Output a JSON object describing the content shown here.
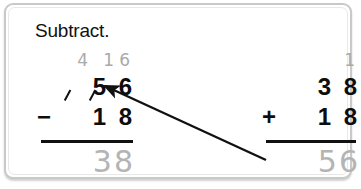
{
  "worksheet": {
    "prompt": "Subtract.",
    "problems": [
      {
        "id": "subtraction",
        "regroup": "4 16",
        "minuend": "5 6",
        "operator": "−",
        "subtrahend": "1 8",
        "answer": "38",
        "crossed_out": true
      },
      {
        "id": "addition-check",
        "regroup": "1",
        "minuend": "3 8",
        "operator": "+",
        "subtrahend": "1 8",
        "answer": "56",
        "crossed_out": false
      }
    ],
    "arrow": {
      "name": "check-arrow",
      "from_label": "56",
      "to_label": "56",
      "color": "#111111"
    },
    "colors": {
      "ink": "#0d0d0d",
      "pencil_gray": "#b4b4b4",
      "frame": "#c9c9c9",
      "page": "#ffffff"
    }
  }
}
